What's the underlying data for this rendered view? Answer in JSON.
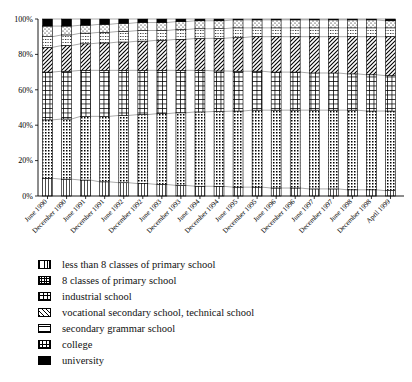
{
  "chart_data": {
    "type": "bar",
    "subtype": "stacked-100-percent",
    "title": "",
    "xlabel": "",
    "ylabel": "",
    "ylim": [
      0,
      100
    ],
    "yticks": [
      "0%",
      "20%",
      "40%",
      "60%",
      "80%",
      "100%"
    ],
    "ytick_values": [
      0,
      20,
      40,
      60,
      80,
      100
    ],
    "grid": false,
    "legend_position": "below",
    "connector_lines": true,
    "categories": [
      "June 1990",
      "December 1990",
      "June 1991",
      "December 1991",
      "June 1992",
      "December 1992",
      "June 1993",
      "December 1993",
      "June 1994",
      "December 1994",
      "June 1995",
      "December 1995",
      "June 1996",
      "December 1996",
      "June 1997",
      "December 1997",
      "June 1998",
      "December 1998",
      "April 1999"
    ],
    "series": [
      {
        "name": "less than 8 classes of primary school",
        "pattern": "vertical-lines",
        "values": [
          10,
          9.5,
          9,
          8,
          7.5,
          7,
          6.5,
          6,
          5.5,
          5.5,
          5,
          5,
          4.5,
          4.5,
          4,
          4,
          3.5,
          3.5,
          3
        ]
      },
      {
        "name": "8 classes of primary school",
        "pattern": "dense-dots",
        "values": [
          33,
          34,
          36,
          37,
          38,
          39,
          40,
          41,
          42,
          42.5,
          43,
          43.5,
          44,
          44,
          44.5,
          44.5,
          45,
          44.5,
          45
        ]
      },
      {
        "name": "industrial school",
        "pattern": "grid",
        "values": [
          27,
          27,
          26,
          26,
          25.5,
          25,
          24.5,
          24,
          23.5,
          23,
          22.5,
          22,
          21.5,
          21.5,
          21,
          21,
          20.5,
          20.5,
          20
        ]
      },
      {
        "name": "vocational secondary school, technical school",
        "pattern": "diagonal-hatch",
        "values": [
          14,
          14.5,
          15,
          15.5,
          16,
          16.5,
          17,
          17.5,
          18,
          18.5,
          19,
          19.5,
          20,
          20,
          20.5,
          20.5,
          21,
          21.5,
          22
        ]
      },
      {
        "name": "secondary grammar school",
        "pattern": "horizontal-dotted",
        "values": [
          6,
          6,
          6,
          6,
          6,
          6,
          5.5,
          5.5,
          5.5,
          5.5,
          5.5,
          5,
          5,
          5,
          5,
          5,
          5,
          5,
          5
        ]
      },
      {
        "name": "college",
        "pattern": "sparse-dots",
        "values": [
          6,
          5,
          4.5,
          4.5,
          4.5,
          4.5,
          4.5,
          4.5,
          4.5,
          4.5,
          4.5,
          4.5,
          4.5,
          4.5,
          4.5,
          4.5,
          4.5,
          4.5,
          4
        ]
      },
      {
        "name": "university",
        "pattern": "solid-black",
        "values": [
          4,
          4,
          3.5,
          3,
          2.5,
          2,
          2,
          1.5,
          1,
          1,
          0.5,
          0.5,
          0.5,
          0.5,
          0.5,
          0.5,
          0.5,
          0.5,
          1
        ]
      }
    ]
  },
  "legend": {
    "items": [
      {
        "label": "less than 8 classes of primary school",
        "pattern": "vertical-lines"
      },
      {
        "label": "8 classes of primary school",
        "pattern": "dense-dots"
      },
      {
        "label": "industrial school",
        "pattern": "grid"
      },
      {
        "label": "vocational secondary school, technical school",
        "pattern": "diagonal-hatch"
      },
      {
        "label": "secondary grammar school",
        "pattern": "horizontal-dotted"
      },
      {
        "label": "college",
        "pattern": "sparse-dots"
      },
      {
        "label": "university",
        "pattern": "solid-black"
      }
    ]
  },
  "colors": {
    "ink": "#000000",
    "background": "#ffffff",
    "connector": "#555555"
  }
}
